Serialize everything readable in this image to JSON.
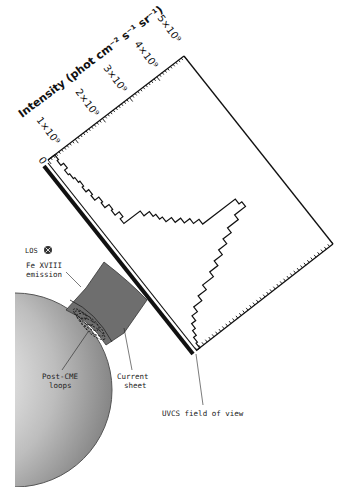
{
  "labels": {
    "y_axis_title": "Intensity (phot cm⁻² s⁻¹ sr⁻¹)",
    "tick_0": "0",
    "tick_1": "1×10⁹",
    "tick_2": "2×10⁹",
    "tick_3": "3×10⁹",
    "tick_4": "4×10⁹",
    "tick_5": "5×10⁹",
    "los": "LOS",
    "fe_line1": "Fe XVIII",
    "fe_line2": "emission",
    "loops_line1": "Post-CME",
    "loops_line2": "loops",
    "sheet_line1": "Current",
    "sheet_line2": "sheet",
    "uvcs": "UVCS field of view"
  },
  "icons": {
    "los_symbol": "circled-x-icon"
  },
  "colors": {
    "ink": "#111111",
    "sheet_fill": "#6e6e6e",
    "sun_light": "#ffffff",
    "sun_dark": "#8a8a8a"
  },
  "chart_data": {
    "type": "histogram",
    "orientation": "rotated ~37deg; intensity axis along upper-left edge, position along UVCS slit",
    "title": "",
    "ylabel": "Intensity (phot cm^-2 s^-1 sr^-1)",
    "xlabel": "Position along UVCS slit",
    "ylim": [
      0,
      5000000000.0
    ],
    "yticks": [
      0,
      1000000000.0,
      2000000000.0,
      3000000000.0,
      4000000000.0,
      5000000000.0
    ],
    "series": [
      {
        "name": "Fe XVIII intensity",
        "bins": 40,
        "values_e9": [
          0.25,
          0.2,
          0.3,
          0.2,
          0.25,
          0.3,
          0.35,
          0.3,
          0.4,
          0.35,
          0.5,
          0.45,
          0.6,
          0.55,
          0.7,
          0.6,
          1.2,
          1.4,
          1.5,
          1.6,
          1.8,
          2.0,
          2.2,
          2.4,
          3.6,
          3.7,
          3.3,
          2.9,
          2.6,
          2.3,
          2.0,
          1.7,
          1.3,
          1.0,
          0.7,
          0.5,
          0.35,
          0.25,
          0.15,
          0.1
        ]
      }
    ]
  }
}
